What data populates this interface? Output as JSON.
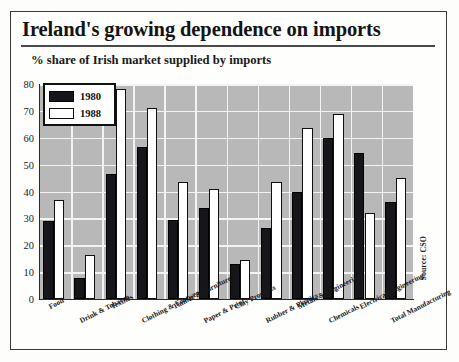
{
  "header": {
    "title": "Ireland's growing dependence on imports",
    "subtitle": "% share of Irish market supplied by imports"
  },
  "source_note": "Source: CSO",
  "legend": {
    "position": "top-left-inside-plot",
    "entries": [
      {
        "label": "1980",
        "color": "#15151a",
        "style": "filled-black"
      },
      {
        "label": "1988",
        "color": "#ffffff",
        "style": "outlined-white"
      }
    ]
  },
  "chart_data": {
    "type": "bar",
    "title": "Ireland's growing dependence on imports",
    "subtitle": "% share of Irish market supplied by imports",
    "xlabel": "",
    "ylabel": "",
    "ylim": [
      0,
      80
    ],
    "yticks": [
      0,
      10,
      20,
      30,
      40,
      50,
      60,
      70,
      80
    ],
    "ytick_labels": [
      "0",
      "10",
      "20",
      "30",
      "40",
      "50",
      "60",
      "70",
      "80"
    ],
    "grid": true,
    "grid_axis": "both",
    "legend_position": "upper left",
    "categories": [
      "Food",
      "Drink & Tobacco",
      "Textiles",
      "Clothing & Footwear",
      "Timber & Furniture",
      "Paper & Print",
      "Clay Products",
      "Rubber & Plastics",
      "Metals & Engineering",
      "Chemicals",
      "Electrical Engineering",
      "Total Manufacturing"
    ],
    "series": [
      {
        "name": "1980",
        "color": "#15151a",
        "values": [
          29,
          8,
          46.5,
          56.5,
          29.5,
          34,
          13,
          26.5,
          40,
          60,
          54.5,
          36
        ]
      },
      {
        "name": "1988",
        "color": "#ffffff",
        "values": [
          37,
          16.5,
          78,
          71,
          43.5,
          41,
          14.5,
          43.5,
          63.5,
          69,
          32,
          45
        ]
      }
    ]
  }
}
